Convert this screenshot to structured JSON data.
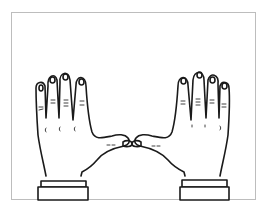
{
  "illustration": {
    "subject": "two hands, palms facing viewer, fingers up, thumb tips touching",
    "style": "black ink line drawing on white",
    "colors": {
      "ink": "#1a1a1a",
      "background": "#ffffff",
      "frame": "#bdbdbd"
    }
  }
}
